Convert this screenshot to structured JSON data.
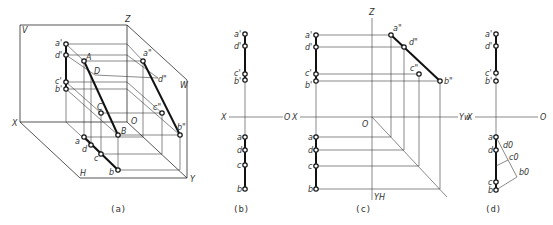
{
  "figure": {
    "captions": [
      "(a)",
      "(b)",
      "(c)",
      "(d)"
    ]
  },
  "panel_a": {
    "caption": "(a)",
    "plane_labels": {
      "V": "V",
      "W": "W",
      "H": "H"
    },
    "axis_labels": {
      "X": "X",
      "Y": "Y",
      "Z": "Z",
      "O": "O"
    },
    "space_points": {
      "A": "A",
      "B": "B",
      "C": "C",
      "D": "D"
    },
    "front_proj": {
      "a": "a'",
      "d": "d'",
      "c": "c'",
      "b": "b'"
    },
    "side_proj": {
      "a": "a\"",
      "d": "d\"",
      "c": "c\"",
      "b": "b\""
    },
    "top_proj": {
      "a": "a",
      "d": "d",
      "c": "c",
      "b": "b"
    }
  },
  "panel_b": {
    "caption": "(b)",
    "axis_labels": {
      "X": "X",
      "O": "O"
    },
    "front_proj": {
      "a": "a'",
      "d": "d'",
      "c": "c'",
      "b": "b'"
    },
    "top_proj": {
      "a": "a",
      "d": "d",
      "c": "c",
      "b": "b"
    }
  },
  "panel_c": {
    "caption": "(c)",
    "axis_labels": {
      "X": "X",
      "O": "O",
      "Z": "Z",
      "YW": "Yw",
      "YH": "YH"
    },
    "front_proj": {
      "a": "a'",
      "d": "d'",
      "c": "c'",
      "b": "b'"
    },
    "side_proj": {
      "a": "a\"",
      "d": "d\"",
      "c": "c\"",
      "b": "b\""
    },
    "top_proj": {
      "a": "a",
      "d": "d",
      "c": "c",
      "b": "b"
    }
  },
  "panel_d": {
    "caption": "(d)",
    "axis_labels": {
      "X": "X",
      "O": "O"
    },
    "front_proj": {
      "a": "a'",
      "d": "d'",
      "c": "c'",
      "b": "b'"
    },
    "top_proj": {
      "a": "a",
      "d": "d",
      "c": "c",
      "b": "b"
    },
    "construction": {
      "d0": "d0",
      "c0": "c0",
      "b0": "b0"
    }
  }
}
